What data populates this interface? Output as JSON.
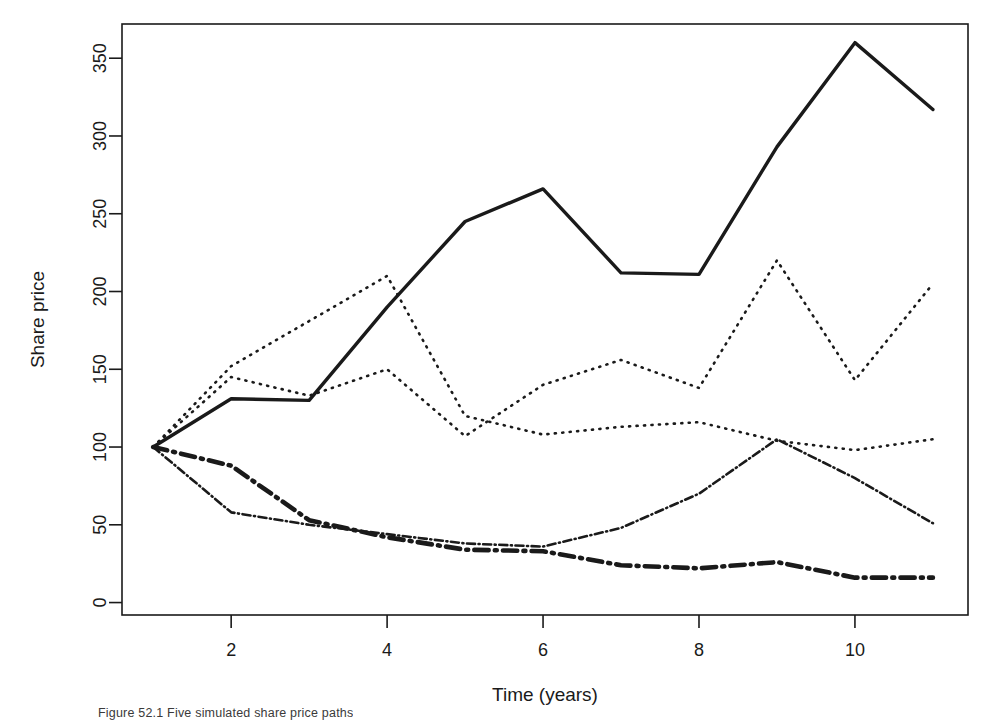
{
  "figure": {
    "caption": "Figure 52.1   Five simulated share price paths",
    "background": "#ffffff",
    "ink_color": "#1a1a1a"
  },
  "axes": {
    "x_label": "Time (years)",
    "y_label": "Share price",
    "x_ticks": [
      "2",
      "4",
      "6",
      "8",
      "10"
    ],
    "y_ticks": [
      "0",
      "50",
      "100",
      "150",
      "200",
      "250",
      "300",
      "350"
    ]
  },
  "chart_data": {
    "type": "line",
    "title": "",
    "xlabel": "Time (years)",
    "ylabel": "Share price",
    "xlim": [
      0.6,
      11.45
    ],
    "ylim": [
      -8,
      372
    ],
    "x_tick_values": [
      2,
      4,
      6,
      8,
      10
    ],
    "y_tick_values": [
      0,
      50,
      100,
      150,
      200,
      250,
      300,
      350
    ],
    "grid": false,
    "legend": "none",
    "x": [
      1,
      2,
      3,
      4,
      5,
      6,
      7,
      8,
      9,
      10,
      11
    ],
    "series": [
      {
        "name": "Path 1",
        "style": "solid",
        "width": 3.4,
        "values": [
          100,
          131,
          130,
          190,
          245,
          266,
          212,
          211,
          293,
          360,
          317
        ]
      },
      {
        "name": "Path 2",
        "style": "dotted",
        "width": 2.6,
        "values": [
          100,
          152,
          181,
          210,
          120,
          108,
          113,
          116,
          104,
          98,
          105
        ]
      },
      {
        "name": "Path 3",
        "style": "dotted",
        "width": 2.6,
        "values": [
          100,
          145,
          133,
          150,
          107,
          140,
          156,
          138,
          220,
          143,
          205
        ]
      },
      {
        "name": "Path 4",
        "style": "dashdot",
        "width": 2.6,
        "values": [
          100,
          58,
          50,
          44,
          38,
          36,
          48,
          70,
          105,
          80,
          51
        ]
      },
      {
        "name": "Path 5",
        "style": "dashdot",
        "width": 4.6,
        "values": [
          100,
          88,
          53,
          42,
          34,
          33,
          24,
          22,
          26,
          16,
          16
        ]
      }
    ]
  }
}
